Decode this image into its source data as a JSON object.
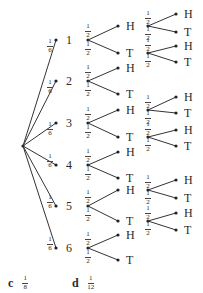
{
  "diagram": {
    "type": "probability-tree",
    "root": {
      "x": 23,
      "y": 146
    },
    "die_branch_probability": {
      "num": "1",
      "den": "6"
    },
    "coin_branch_probability": {
      "num": "1",
      "den": "2"
    },
    "die_outcomes": [
      {
        "label": "1",
        "x": 56,
        "y": 40,
        "coins": [
          {
            "label": "H",
            "y": 26,
            "second": [
              {
                "label": "H",
                "y": 14
              },
              {
                "label": "T",
                "y": 32
              }
            ]
          },
          {
            "label": "T",
            "y": 53,
            "second": [
              {
                "label": "H",
                "y": 46
              },
              {
                "label": "T",
                "y": 62
              }
            ]
          }
        ]
      },
      {
        "label": "2",
        "x": 56,
        "y": 81,
        "coins": [
          {
            "label": "H",
            "y": 68,
            "second": []
          },
          {
            "label": "T",
            "y": 94,
            "second": []
          }
        ]
      },
      {
        "label": "3",
        "x": 56,
        "y": 123,
        "coins": [
          {
            "label": "H",
            "y": 110,
            "second": [
              {
                "label": "H",
                "y": 97
              },
              {
                "label": "T",
                "y": 113
              }
            ]
          },
          {
            "label": "T",
            "y": 137,
            "second": [
              {
                "label": "H",
                "y": 130
              },
              {
                "label": "T",
                "y": 146
              }
            ]
          }
        ]
      },
      {
        "label": "4",
        "x": 56,
        "y": 165,
        "coins": [
          {
            "label": "H",
            "y": 152,
            "second": []
          },
          {
            "label": "T",
            "y": 178,
            "second": []
          }
        ]
      },
      {
        "label": "5",
        "x": 56,
        "y": 206,
        "coins": [
          {
            "label": "H",
            "y": 190,
            "second": [
              {
                "label": "H",
                "y": 180
              },
              {
                "label": "T",
                "y": 198
              }
            ]
          },
          {
            "label": "T",
            "y": 221,
            "second": [
              {
                "label": "H",
                "y": 213
              },
              {
                "label": "T",
                "y": 230
              }
            ]
          }
        ]
      },
      {
        "label": "6",
        "x": 56,
        "y": 248,
        "coins": [
          {
            "label": "H",
            "y": 235,
            "second": []
          },
          {
            "label": "T",
            "y": 260,
            "second": []
          }
        ]
      }
    ]
  },
  "answers": [
    {
      "letter": "c",
      "num": "1",
      "den": "8"
    },
    {
      "letter": "d",
      "num": "1",
      "den": "12"
    }
  ]
}
